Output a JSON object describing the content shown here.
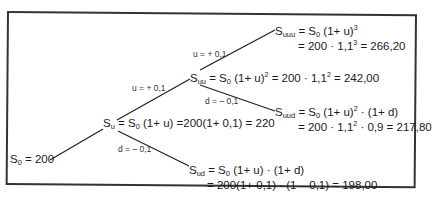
{
  "tree": {
    "root": {
      "name": "S",
      "sub": "0",
      "rest": " = 200"
    },
    "su": {
      "name": "S",
      "sub": "u",
      "eq": " = S",
      "eq_sub": "0",
      "rest": " (1+ u) =200(1+ 0,1) = 220"
    },
    "suu": {
      "name": "S",
      "sub": "uu",
      "eq": " = S",
      "eq_sub": "0",
      "p1": " (1+ u)",
      "p1_sup": "2",
      "p2": " = 200 · 1,1",
      "p2_sup": "2",
      "p3": " = 242,00"
    },
    "suuu": {
      "name": "S",
      "sub": "uuu",
      "eq": " = S",
      "eq_sub": "0",
      "p1": " (1+ u)",
      "p1_sup": "3",
      "line2a": "= 200 · 1,1",
      "line2_sup": "3",
      "line2b": " = 266,20"
    },
    "suud": {
      "name": "S",
      "sub": "uud",
      "eq": " = S",
      "eq_sub": "0",
      "p1": " (1+ u)",
      "p1_sup": "2",
      "p2": " · (1+ d)",
      "line2a": "= 200 · 1,1",
      "line2_sup": "2",
      "line2b": " · 0,9 = 217,80"
    },
    "sud": {
      "name": "S",
      "sub": "ud",
      "eq": " = S",
      "eq_sub": "0",
      "p1": " (1+ u) · (1+ d)",
      "line2": "= 200(1+ 0,1) · (1 – 0,1) = 198,00"
    },
    "labels": {
      "u1": "u = + 0,1",
      "d1": "d = – 0,1",
      "u2": "u = + 0,1",
      "d2": "d = – 0,1"
    }
  }
}
